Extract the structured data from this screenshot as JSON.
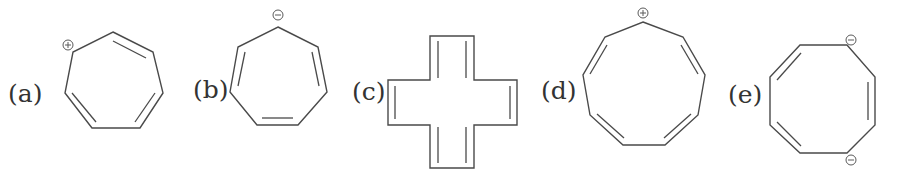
{
  "figure": {
    "structures": [
      {
        "id": "a",
        "label": "(a)",
        "name": "cycloheptatrienyl cation",
        "ring_size": 7,
        "charges": [
          "+"
        ],
        "double_bonds": 3
      },
      {
        "id": "b",
        "label": "(b)",
        "name": "cycloheptatrienyl anion",
        "ring_size": 7,
        "charges": [
          "−"
        ],
        "double_bonds": 3
      },
      {
        "id": "c",
        "label": "(c)",
        "name": "cross-shaped polyene",
        "ring_size": 12,
        "charges": [],
        "double_bonds": 6
      },
      {
        "id": "d",
        "label": "(d)",
        "name": "cyclononatetraenyl cation",
        "ring_size": 9,
        "charges": [
          "+"
        ],
        "double_bonds": 4
      },
      {
        "id": "e",
        "label": "(e)",
        "name": "cyclooctatriene dianion",
        "ring_size": 8,
        "charges": [
          "−",
          "−"
        ],
        "double_bonds": 3
      }
    ]
  },
  "colors": {
    "line": "#4a4a4a",
    "text": "#333333",
    "background": "#ffffff"
  }
}
